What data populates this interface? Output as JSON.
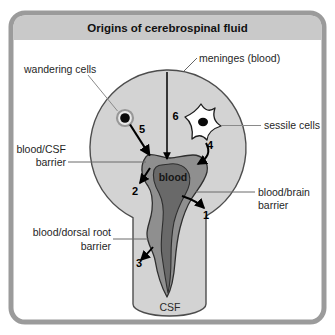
{
  "title": "Origins of cerebrospinal fluid",
  "labels": {
    "meninges": "meninges (blood)",
    "wandering_cells": "wandering cells",
    "sessile_cells": "sessile cells",
    "blood_csf_barrier": {
      "line1": "blood/CSF",
      "line2": "barrier"
    },
    "blood_brain_barrier": {
      "line1": "blood/brain",
      "line2": "barrier"
    },
    "blood_dorsal_root_barrier": {
      "line1": "blood/dorsal root",
      "line2": "barrier"
    },
    "blood": "blood",
    "csf": "CSF"
  },
  "numbers": {
    "route1": "1",
    "route2": "2",
    "route3": "3",
    "route4": "4",
    "route5": "5",
    "route6": "6"
  },
  "icons": {
    "wandering_cell": "wandering-cell-icon",
    "sessile_cell": "sessile-cell-icon"
  },
  "colors": {
    "panel_border": "#9b9b9b",
    "title_band": "#c9c9c9",
    "tissue_fill": "#d3d3d3",
    "tissue_stroke": "#4d4d4d",
    "vessel_outer": "#8f8f8f",
    "vessel_inner": "#696969",
    "vessel_stroke": "#2e2e2e",
    "arrow": "#000000",
    "leader_line": "#6a6a6a",
    "text": "#1f1f1f"
  }
}
